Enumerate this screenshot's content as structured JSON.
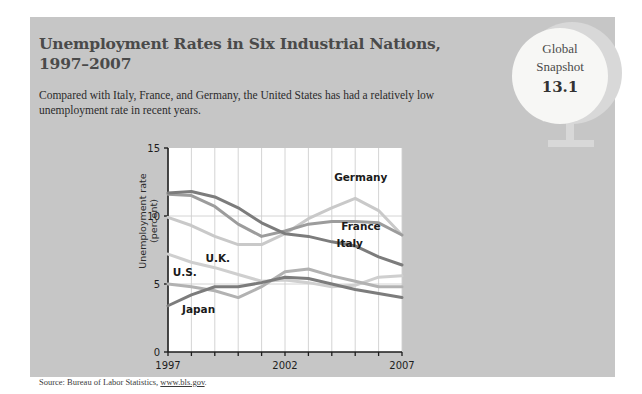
{
  "card": {
    "title": "Unemployment Rates in Six Industrial Nations, 1997–2007",
    "subtitle": "Compared with Italy, France, and Germany, the United States has had a relatively low unemployment rate in recent years.",
    "source_prefix": "Source: Bureau of Labor Statistics, ",
    "source_link": "www.bls.gov",
    "source_suffix": ".",
    "background_color": "#c6c6c6"
  },
  "badge": {
    "line1": "Global",
    "line2": "Snapshot",
    "number": "13.1",
    "icon": "globe-icon",
    "color": "#f7f7f5"
  },
  "chart_data": {
    "type": "line",
    "title": "Unemployment Rates in Six Industrial Nations, 1997–2007",
    "xlabel": "",
    "ylabel": "Unemployment rate (percent)",
    "xlim": [
      1997,
      2007
    ],
    "ylim": [
      0,
      15
    ],
    "yticks": [
      0,
      5,
      10,
      15
    ],
    "ytick_labels": [
      "0",
      "5",
      "10",
      "15"
    ],
    "xticks": [
      1997,
      1998,
      1999,
      2000,
      2001,
      2002,
      2003,
      2004,
      2005,
      2006,
      2007
    ],
    "xtick_labels_shown": [
      "1997",
      "2002",
      "2007"
    ],
    "grid": true,
    "legend": "inline-labels",
    "x": [
      1997,
      1998,
      1999,
      2000,
      2001,
      2002,
      2003,
      2004,
      2005,
      2006,
      2007
    ],
    "series": [
      {
        "name": "Germany",
        "color": "#c9c9c9",
        "values": [
          9.9,
          9.3,
          8.5,
          7.9,
          7.9,
          8.7,
          9.8,
          10.6,
          11.3,
          10.4,
          8.6
        ]
      },
      {
        "name": "France",
        "color": "#9c9c9c",
        "values": [
          11.6,
          11.5,
          10.7,
          9.4,
          8.5,
          8.9,
          9.4,
          9.6,
          9.6,
          9.5,
          8.6
        ]
      },
      {
        "name": "Italy",
        "color": "#7c7c7c",
        "values": [
          11.7,
          11.8,
          11.4,
          10.6,
          9.5,
          8.7,
          8.5,
          8.1,
          7.8,
          7.0,
          6.4
        ]
      },
      {
        "name": "U.K.",
        "color": "#cfcfcf",
        "values": [
          7.2,
          6.6,
          6.2,
          5.7,
          5.2,
          5.3,
          5.1,
          4.8,
          4.9,
          5.5,
          5.6
        ]
      },
      {
        "name": "U.S.",
        "color": "#b2b2b2",
        "values": [
          5.0,
          4.8,
          4.5,
          4.0,
          4.8,
          5.9,
          6.1,
          5.6,
          5.2,
          4.8,
          4.8
        ]
      },
      {
        "name": "Japan",
        "color": "#7c7c7c",
        "values": [
          3.4,
          4.2,
          4.8,
          4.8,
          5.1,
          5.5,
          5.4,
          5.0,
          4.6,
          4.3,
          4.0
        ]
      }
    ],
    "annotations": [
      {
        "text": "Germany",
        "x": 2004.1,
        "y": 12.6
      },
      {
        "text": "France",
        "x": 2004.4,
        "y": 9.0
      },
      {
        "text": "Italy",
        "x": 2004.2,
        "y": 7.7
      },
      {
        "text": "U.K.",
        "x": 1998.6,
        "y": 6.6
      },
      {
        "text": "U.S.",
        "x": 1997.2,
        "y": 5.6
      },
      {
        "text": "Japan",
        "x": 1997.6,
        "y": 2.9
      }
    ]
  }
}
